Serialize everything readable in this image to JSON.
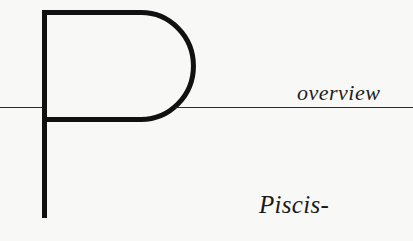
{
  "page": {
    "drop_cap": "P",
    "section_label": "overview",
    "heading_fragment": "Piscis-"
  },
  "colors": {
    "background": "#f8f8f6",
    "ink": "#111111"
  }
}
